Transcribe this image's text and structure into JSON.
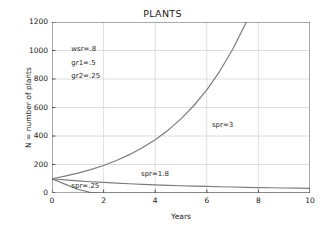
{
  "chart_data": {
    "type": "line",
    "title": "PLANTS",
    "xlabel": "Years",
    "ylabel": "N = number of plants",
    "xlim": [
      0,
      10
    ],
    "ylim": [
      0,
      1200
    ],
    "xticks": [
      "0",
      "2",
      "4",
      "6",
      "8",
      "10"
    ],
    "xtick_values": [
      0,
      2,
      4,
      6,
      8,
      10
    ],
    "yticks": [
      "0",
      "200",
      "400",
      "600",
      "800",
      "1000",
      "1200"
    ],
    "ytick_values": [
      0,
      200,
      400,
      600,
      800,
      1000,
      1200
    ],
    "grid": true,
    "legend": "none",
    "line_color": "#7d7d7d",
    "grid_color": "#d6d6d6",
    "axis_color": "#555555",
    "background": "#ffffff",
    "x": [
      0,
      0.5,
      1,
      1.5,
      2,
      2.5,
      3,
      3.5,
      4,
      4.5,
      5,
      5.5,
      6,
      6.5,
      7,
      7.5,
      8,
      8.5,
      9,
      9.5,
      10
    ],
    "series": [
      {
        "name": "spr=3",
        "label": "spr=3",
        "label_x": 6.2,
        "label_y": 470,
        "values": [
          100,
          118,
          139,
          164,
          193,
          228,
          269,
          317,
          374,
          441,
          520,
          614,
          724,
          854,
          1007,
          1188,
          1401,
          1652,
          1949,
          2298,
          2710
        ]
      },
      {
        "name": "spr=1.8",
        "label": "spr=1.8",
        "label_x": 3.45,
        "label_y": 128,
        "values": [
          100,
          92,
          85,
          79,
          74,
          69,
          65,
          61,
          57,
          54,
          51,
          48,
          46,
          44,
          42,
          40,
          38,
          37,
          35,
          34,
          33
        ]
      },
      {
        "name": "spr=.25",
        "label": "spr=.25",
        "label_x": 0.75,
        "label_y": 42,
        "values": [
          100,
          62,
          26,
          3,
          0,
          0,
          0,
          0,
          0,
          0,
          0,
          0,
          0,
          0,
          0,
          0,
          0,
          0,
          0,
          0,
          0
        ]
      }
    ],
    "annotations": [
      {
        "text": "wsr=.8",
        "x": 0.75,
        "y": 1005
      },
      {
        "text": "gr1=.5",
        "x": 0.75,
        "y": 907
      },
      {
        "text": "gr2=.25",
        "x": 0.75,
        "y": 812
      }
    ]
  }
}
